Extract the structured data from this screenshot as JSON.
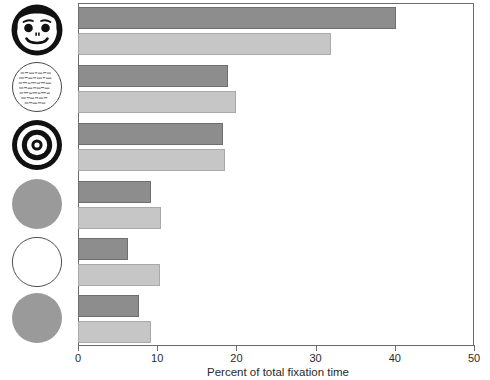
{
  "chart_data": {
    "type": "bar",
    "orientation": "horizontal",
    "title": "",
    "subtitle": "",
    "xlabel": "Percent of total fixation time",
    "ylabel": "",
    "xlim": [
      0,
      50
    ],
    "xticks": [
      0,
      10,
      20,
      30,
      40,
      50
    ],
    "xtick_labels": [
      "0",
      "10",
      "20",
      "30",
      "40",
      "50"
    ],
    "grid": false,
    "legend": "none",
    "categories": [
      "face",
      "text-circle",
      "bullseye",
      "gray-disc-top",
      "white-circle",
      "gray-disc-bottom"
    ],
    "category_icons": [
      "face-icon",
      "text-circle-icon",
      "bullseye-icon",
      "gray-disc-icon",
      "white-circle-icon",
      "gray-disc-icon"
    ],
    "series": [
      {
        "name": "dark",
        "color": "#8d8d8d",
        "values": [
          40.2,
          19.0,
          18.3,
          9.2,
          6.3,
          7.7
        ]
      },
      {
        "name": "light",
        "color": "#c6c6c6",
        "values": [
          32.0,
          20.0,
          18.5,
          10.5,
          10.4,
          9.2
        ]
      }
    ]
  },
  "axis": {
    "x_label": "Percent of total fixation time",
    "tick_labels": [
      "0",
      "10",
      "20",
      "30",
      "40",
      "50"
    ]
  },
  "colors": {
    "dark_bar": "#8d8d8d",
    "light_bar": "#c6c6c6",
    "axis": "#6b6b6b",
    "background": "#ffffff"
  }
}
